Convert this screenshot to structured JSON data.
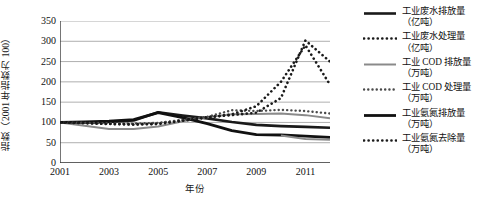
{
  "chart_data": {
    "type": "line",
    "title": "",
    "xlabel": "年份",
    "ylabel": "指数（2001 年指数为 100）",
    "grid": true,
    "legend_position": "right",
    "xlim": [
      2001,
      2012
    ],
    "ylim": [
      0,
      350
    ],
    "ytick_step": 50,
    "yticks": [
      0,
      50,
      100,
      150,
      200,
      250,
      300,
      350
    ],
    "ytick_labels": [
      "0",
      "50",
      "100",
      "150",
      "200",
      "250",
      "300",
      "350"
    ],
    "x": [
      2001,
      2002,
      2003,
      2004,
      2005,
      2006,
      2007,
      2008,
      2009,
      2010,
      2011,
      2012
    ],
    "xticks": [
      2001,
      2002,
      2003,
      2004,
      2005,
      2006,
      2007,
      2008,
      2009,
      2010,
      2011,
      2012
    ],
    "xtick_labels": [
      "2001",
      "",
      "2003",
      "",
      "2005",
      "",
      "2007",
      "",
      "2009",
      "",
      "2011",
      ""
    ],
    "series": [
      {
        "name": "工业废水排放量\n（亿吨）",
        "style": "solid",
        "color": "#1a1a1a",
        "width": 2.6,
        "values": [
          100,
          100,
          101,
          105,
          125,
          117,
          110,
          101,
          94,
          91,
          89,
          87
        ]
      },
      {
        "name": "工业废水处理量\n（亿吨）",
        "style": "dotted",
        "color": "#1a1a1a",
        "width": 2.6,
        "values": [
          100,
          99,
          97,
          95,
          97,
          106,
          113,
          118,
          124,
          160,
          302,
          250
        ]
      },
      {
        "name": "工业 COD 排放量\n（万吨）",
        "style": "solid",
        "color": "#8a8a8a",
        "width": 2.0,
        "values": [
          100,
          92,
          84,
          84,
          90,
          103,
          113,
          120,
          121,
          122,
          118,
          110
        ]
      },
      {
        "name": "工业 COD 处理量\n（万吨）",
        "style": "dotted",
        "color": "#4a4a4a",
        "width": 2.4,
        "values": [
          100,
          99,
          98,
          97,
          99,
          106,
          114,
          130,
          128,
          131,
          128,
          122
        ]
      },
      {
        "name": "工业氨氮排放量\n（万吨）",
        "style": "solid",
        "color": "#111111",
        "width": 2.8,
        "values": [
          100,
          101,
          103,
          107,
          124,
          112,
          97,
          80,
          70,
          69,
          66,
          63
        ]
      },
      {
        "name": "工业氨氮去除量\n（万吨）",
        "style": "dotted",
        "color": "#1a1a1a",
        "width": 2.6,
        "values": [
          100,
          98,
          96,
          95,
          96,
          104,
          112,
          120,
          140,
          200,
          290,
          193
        ]
      }
    ],
    "extra_series": [
      {
        "name": "工业 COD 排放量（低位尾段）",
        "style": "solid",
        "color": "#8a8a8a",
        "width": 2.0,
        "values": [
          null,
          null,
          null,
          null,
          null,
          null,
          null,
          null,
          null,
          68,
          59,
          57
        ]
      }
    ]
  },
  "axis_colors": {
    "gridline": "#9a9a9a",
    "axis": "#3a3a3a",
    "text": "#111111",
    "background": "#ffffff"
  }
}
